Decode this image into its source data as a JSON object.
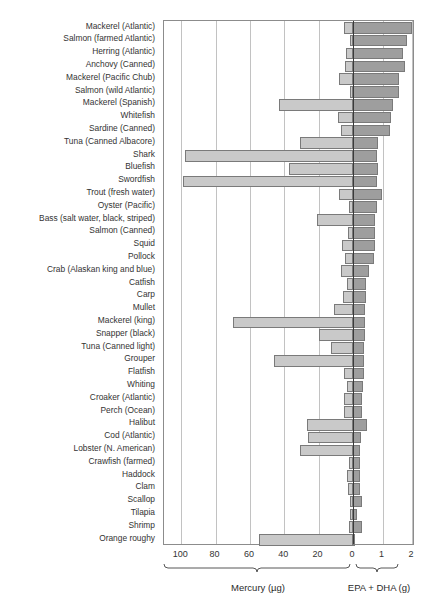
{
  "chart_data": {
    "type": "bar",
    "orientation": "horizontal-diverging",
    "title": "",
    "subtitle": "",
    "grid": true,
    "legend": "none",
    "left_axis": {
      "label": "Mercury (µg)",
      "unit": "µg",
      "direction": "leftward-from-zero",
      "ticks": [
        100,
        80,
        60,
        40,
        20,
        0
      ],
      "tick_labels": [
        "100",
        "80",
        "60",
        "40",
        "20",
        "0"
      ],
      "range": [
        0,
        110
      ],
      "series_name": "Mercury"
    },
    "right_axis": {
      "label": "EPA + DHA (g)",
      "unit": "g",
      "direction": "rightward-from-zero",
      "ticks": [
        0,
        1,
        2
      ],
      "tick_labels": [
        "0",
        "1",
        "2"
      ],
      "range": [
        0,
        2
      ],
      "series_name": "EPA + DHA"
    },
    "categories": [
      "Mackerel (Atlantic)",
      "Salmon (farmed Atlantic)",
      "Herring (Atlantic)",
      "Anchovy (Canned)",
      "Mackerel (Pacific Chub)",
      "Salmon (wild Atlantic)",
      "Mackerel (Spanish)",
      "Whitefish",
      "Sardine (Canned)",
      "Tuna (Canned Albacore)",
      "Shark",
      "Bluefish",
      "Swordfish",
      "Trout (fresh water)",
      "Oyster (Pacific)",
      "Bass (salt water, black, striped)",
      "Salmon (Canned)",
      "Squid",
      "Pollock",
      "Crab (Alaskan king and blue)",
      "Catfish",
      "Carp",
      "Mullet",
      "Mackerel (king)",
      "Snapper (black)",
      "Tuna (Canned light)",
      "Grouper",
      "Flatfish",
      "Whiting",
      "Croaker (Atlantic)",
      "Perch (Ocean)",
      "Halibut",
      "Cod (Atlantic)",
      "Lobster (N. American)",
      "Crawfish (farmed)",
      "Haddock",
      "Clam",
      "Scallop",
      "Tilapia",
      "Shrimp",
      "Orange roughy"
    ],
    "series": [
      {
        "name": "Mercury",
        "unit": "µg",
        "axis": "left",
        "color": "#c9c9c9",
        "values": [
          5.0,
          2.0,
          4.0,
          4.5,
          8.0,
          2.0,
          43.0,
          8.5,
          7.0,
          31.0,
          98.0,
          37.0,
          99.0,
          8.0,
          2.5,
          21.0,
          3.0,
          6.5,
          4.5,
          7.0,
          3.5,
          6.0,
          11.0,
          70.0,
          20.0,
          13.0,
          46.0,
          5.5,
          3.5,
          5.0,
          5.5,
          27.0,
          26.0,
          31.0,
          2.5,
          3.5,
          3.0,
          2.0,
          2.0,
          2.5,
          55.0
        ]
      },
      {
        "name": "EPA + DHA",
        "unit": "g",
        "axis": "right",
        "color": "#9e9e9e",
        "values": [
          2.0,
          1.83,
          1.71,
          1.75,
          1.57,
          1.56,
          1.35,
          1.3,
          1.24,
          0.86,
          0.83,
          0.84,
          0.82,
          0.98,
          0.8,
          0.75,
          0.74,
          0.73,
          0.72,
          0.54,
          0.44,
          0.45,
          0.41,
          0.4,
          0.39,
          0.38,
          0.37,
          0.36,
          0.34,
          0.32,
          0.31,
          0.47,
          0.28,
          0.24,
          0.23,
          0.23,
          0.25,
          0.31,
          0.15,
          0.31,
          0.04
        ]
      }
    ]
  },
  "axis_titles": {
    "mercury": "Mercury (µg)",
    "epa_dha": "EPA + DHA (g)"
  }
}
